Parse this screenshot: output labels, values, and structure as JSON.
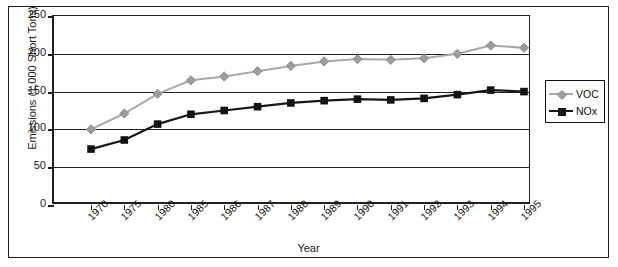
{
  "chart_data": {
    "type": "line",
    "title": "",
    "xlabel": "Year",
    "ylabel": "Emissions (1,000 Short Tons)",
    "categories": [
      "1970",
      "1975",
      "1980",
      "1985",
      "1986",
      "1987",
      "1988",
      "1989",
      "1990",
      "1991",
      "1992",
      "1993",
      "1994",
      "1995"
    ],
    "ylim": [
      0,
      250
    ],
    "yticks": [
      0,
      50,
      100,
      150,
      200,
      250
    ],
    "ytick_labels": [
      "0",
      "50",
      "100",
      "150",
      "200",
      "250"
    ],
    "grid": "horizontal",
    "legend_position": "right",
    "series": [
      {
        "name": "VOC",
        "color": "#a8a8a8",
        "marker": "diamond",
        "values": [
          100,
          121,
          147,
          165,
          170,
          177,
          184,
          190,
          193,
          192,
          194,
          200,
          211,
          208
        ]
      },
      {
        "name": "NOx",
        "color": "#171717",
        "marker": "square",
        "values": [
          74,
          86,
          107,
          120,
          125,
          130,
          135,
          138,
          140,
          139,
          141,
          146,
          152,
          150
        ]
      }
    ]
  },
  "legend": {
    "items": [
      {
        "label": "VOC"
      },
      {
        "label": "NOx"
      }
    ]
  }
}
